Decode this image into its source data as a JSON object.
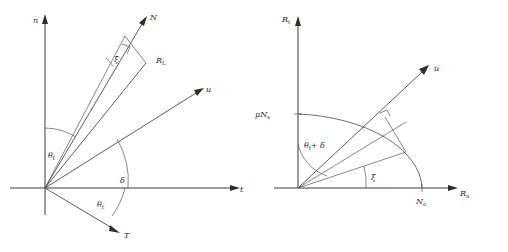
{
  "figure": {
    "panels": [
      {
        "id": "left",
        "name": "n-t force decomposition",
        "axes": {
          "vertical_label": "n",
          "horizontal_label": "t"
        },
        "vectors": [
          {
            "label": "N",
            "name": "normal-force-vector"
          },
          {
            "label": "R",
            "sub": "L",
            "name": "resultant-force-vector"
          },
          {
            "label": "u",
            "name": "displacement-vector"
          },
          {
            "label": "T",
            "name": "tangential-force-vector"
          }
        ],
        "angles": [
          {
            "label": "θ",
            "sub": "f",
            "name": "theta-f-upper"
          },
          {
            "label": "ξ",
            "name": "xi-angle"
          },
          {
            "label": "δ",
            "name": "delta-angle"
          },
          {
            "label": "θ",
            "sub": "f",
            "name": "theta-f-lower"
          }
        ]
      },
      {
        "id": "right",
        "name": "Rn-Rt yield surface",
        "axes": {
          "vertical_label": "R",
          "vertical_sub": "t",
          "horizontal_label": "R",
          "horizontal_sub": "n"
        },
        "ticks": [
          {
            "label": "μN",
            "sub": "s",
            "name": "mu-ns-tick",
            "axis": "vertical"
          },
          {
            "label": "N",
            "sub": "o",
            "name": "no-tick",
            "axis": "horizontal"
          }
        ],
        "vectors": [
          {
            "label": "u",
            "name": "displacement-vector"
          }
        ],
        "angles": [
          {
            "label": "θ",
            "sub": "f",
            "suffix": "+ δ",
            "name": "theta-f-plus-delta-angle"
          },
          {
            "label": "ξ",
            "name": "xi-angle"
          }
        ]
      }
    ],
    "colors": {
      "stroke": "#4a4a4a",
      "axis": "#3a3a3a",
      "text": "#2b2b2b",
      "background": "#ffffff"
    }
  }
}
